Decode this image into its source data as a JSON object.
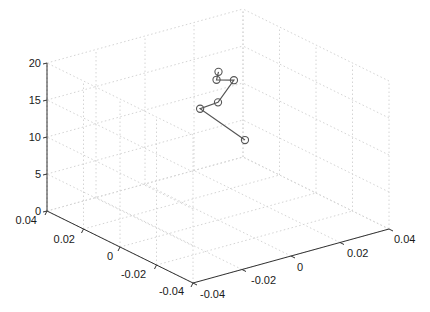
{
  "chart_data": {
    "type": "line3d",
    "title": "",
    "xlabel": "",
    "ylabel": "",
    "zlabel": "",
    "grid": true,
    "legend": null,
    "axes": {
      "y_left": {
        "range": [
          -0.04,
          0.04
        ],
        "ticks": [
          "0.04",
          "0.02",
          "0",
          "-0.02",
          "-0.04"
        ]
      },
      "x_right": {
        "range": [
          -0.04,
          0.04
        ],
        "ticks": [
          "-0.04",
          "-0.02",
          "0",
          "0.02",
          "0.04"
        ]
      },
      "z": {
        "range": [
          0,
          20
        ],
        "ticks": [
          "0",
          "5",
          "10",
          "15",
          "20"
        ]
      }
    },
    "series": [
      {
        "name": "trajectory",
        "marker": "circle",
        "color": "#555555",
        "points": [
          {
            "x": 0.0002,
            "y": 0.0,
            "z": 20.0
          },
          {
            "x": -0.0006,
            "y": 0.0,
            "z": 19.0
          },
          {
            "x": 0.0065,
            "y": 0.0,
            "z": 18.3
          },
          {
            "x": 0.0,
            "y": 0.0,
            "z": 15.9
          },
          {
            "x": -0.0073,
            "y": 0.0,
            "z": 15.7
          },
          {
            "x": 0.011,
            "y": 0.0,
            "z": 9.8
          }
        ]
      }
    ]
  },
  "labels": {
    "z_ticks": [
      "0",
      "5",
      "10",
      "15",
      "20"
    ],
    "left_ticks": [
      "0.04",
      "0.02",
      "0",
      "-0.02",
      "-0.04"
    ],
    "right_ticks": [
      "-0.04",
      "-0.02",
      "0",
      "0.02",
      "0.04"
    ]
  },
  "colors": {
    "line": "#555555",
    "axis": "#333333",
    "grid": "#d4d4d4"
  }
}
